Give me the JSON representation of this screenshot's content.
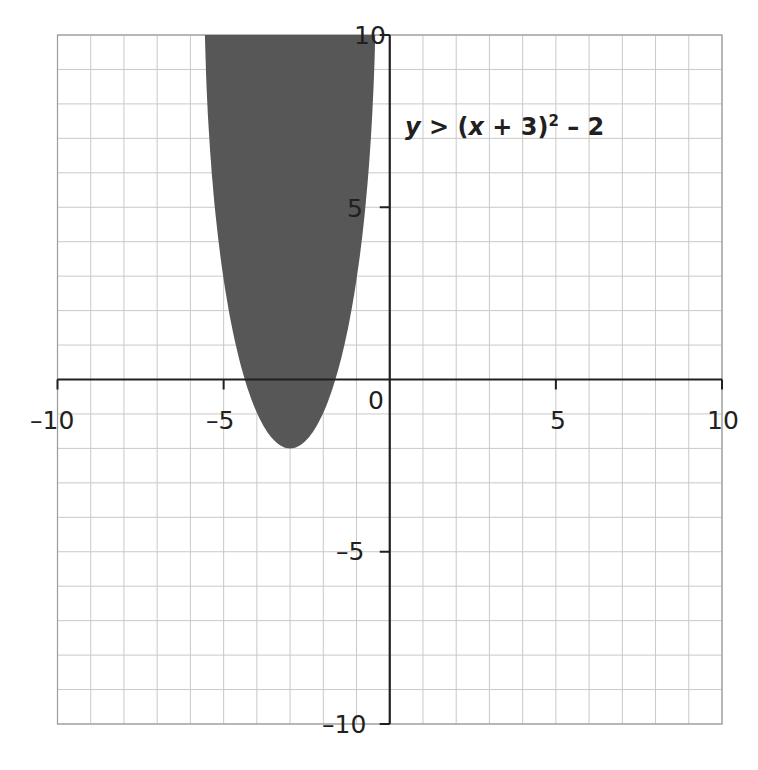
{
  "chart_data": {
    "type": "area",
    "title": "",
    "subtitle": "",
    "xlabel": "",
    "ylabel": "",
    "xlim": [
      -10,
      10
    ],
    "ylim": [
      -10,
      10
    ],
    "grid": true,
    "grid_step": 1,
    "x_ticks": [
      -10,
      -5,
      0,
      5,
      10
    ],
    "y_ticks": [
      10,
      5,
      -5,
      -10
    ],
    "x_tick_labels": [
      "–10",
      "–5",
      "0",
      "5",
      "10"
    ],
    "y_tick_labels": [
      "10",
      "5",
      "–5",
      "–10"
    ],
    "series": [
      {
        "name": "y > (x + 3)² – 2",
        "kind": "inequality-region",
        "boundary": "parabola",
        "vertex": [
          -3,
          -2
        ],
        "x_intercepts": [
          -4.41,
          -1.59
        ],
        "shaded": "inside (above curve)",
        "boundary_style": "no visible boundary line",
        "color": "#575757"
      }
    ],
    "annotations": [
      {
        "text": "y > (x + 3)² – 2",
        "x": 0.5,
        "y": 7.5
      }
    ]
  },
  "labels": {
    "equation_y": "y",
    "equation_mid": " > (",
    "equation_x": "x",
    "equation_rest": " + 3)",
    "equation_exp": "2",
    "equation_tail": " – 2",
    "x_neg10": "–10",
    "x_neg5": "–5",
    "origin": "0",
    "x_pos5": "5",
    "x_pos10": "10",
    "y_pos10": "10",
    "y_pos5": "5",
    "y_neg5": "–5",
    "y_neg10": "–10"
  },
  "colors": {
    "shade": "#575757",
    "grid": "#c9c9c9",
    "axis": "#231f20",
    "background": "#ffffff"
  }
}
